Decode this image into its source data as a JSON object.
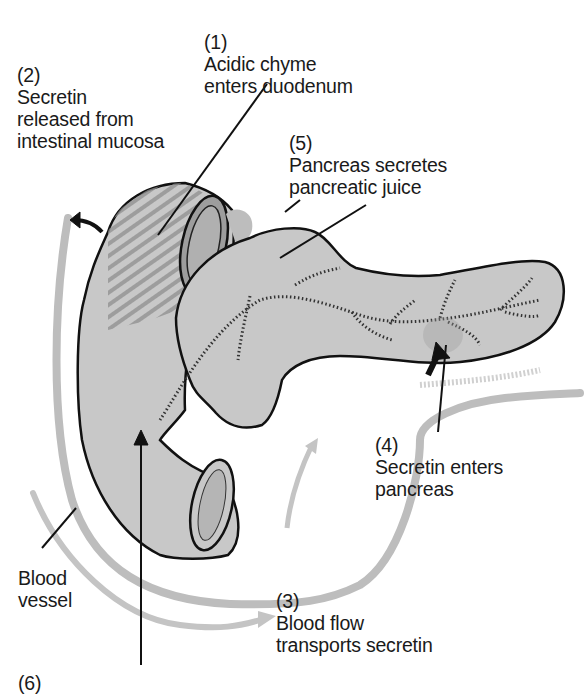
{
  "title": {
    "text": "(cropped title, descenders only visible)"
  },
  "labels": {
    "step1": {
      "number": "(1)",
      "lines": [
        "Acidic chyme",
        "enters duodenum"
      ]
    },
    "step2": {
      "number": "(2)",
      "lines": [
        "Secretin",
        "released from",
        "intestinal mucosa"
      ]
    },
    "step3": {
      "number": "(3)",
      "lines": [
        "Blood flow",
        "transports secretin"
      ]
    },
    "step4": {
      "number": "(4)",
      "lines": [
        "Secretin enters",
        "pancreas"
      ]
    },
    "step5": {
      "number": "(5)",
      "lines": [
        "Pancreas secretes",
        "pancreatic juice"
      ]
    },
    "step6": {
      "number": "(6)",
      "lines": []
    },
    "blood_vessel": {
      "lines": [
        "Blood",
        "vessel"
      ]
    }
  },
  "colors": {
    "organ_fill": "#c8c8c8",
    "vessel": "#bdbdbd",
    "hatch": "#8f8f8f",
    "outline": "#111111",
    "text": "#1a1a1a"
  },
  "parts": [
    "duodenum",
    "pancreas",
    "pancreatic-duct",
    "blood-vessel",
    "jejunum-opening"
  ]
}
